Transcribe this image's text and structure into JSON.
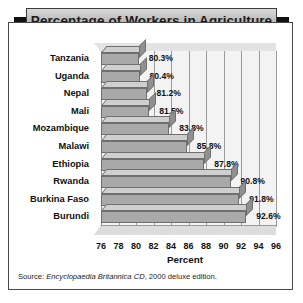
{
  "title": "Percentage of Workers in Agriculture",
  "source": {
    "prefix": "Source: ",
    "italic": "Encyclopaedia Britannica CD",
    "suffix": ", 2000 deluxe edition."
  },
  "colors": {
    "bar_front": "#a9a9a9",
    "bar_top": "#cfcfcf",
    "bar_side": "#909090",
    "plot_background": "#f3f3f3",
    "frame": "#4a4a4a",
    "banner": "#c9c9c9",
    "tab": "#111111",
    "text": "#111111"
  },
  "chart_data": {
    "type": "bar",
    "orientation": "horizontal",
    "title": "Percentage of Workers in Agriculture",
    "xlabel": "Percent",
    "ylabel": "",
    "xlim": [
      76,
      96
    ],
    "xticks": [
      76,
      78,
      80,
      82,
      84,
      86,
      88,
      90,
      92,
      94,
      96
    ],
    "grid": true,
    "legend": false,
    "categories": [
      "Tanzania",
      "Uganda",
      "Nepal",
      "Mali",
      "Mozambique",
      "Malawi",
      "Ethiopia",
      "Rwanda",
      "Burkina Faso",
      "Burundi"
    ],
    "values": [
      80.3,
      80.4,
      81.2,
      81.5,
      83.8,
      85.8,
      87.8,
      90.8,
      91.8,
      92.6
    ],
    "data_labels": [
      "80.3%",
      "80.4%",
      "81.2%",
      "81.5%",
      "83.8%",
      "85.8%",
      "87.8%",
      "90.8%",
      "91.8%",
      "92.6%"
    ]
  }
}
